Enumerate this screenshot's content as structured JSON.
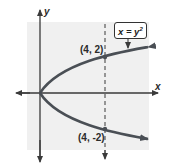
{
  "diagram": {
    "type": "parabola-graph",
    "axes": {
      "x_label": "x",
      "y_label": "y"
    },
    "equation": {
      "lhs": "x = y",
      "exponent": "2"
    },
    "points": [
      {
        "label": "(4, 2)",
        "x": 4,
        "y": 2
      },
      {
        "label": "(4, -2)",
        "x": 4,
        "y": -2
      }
    ],
    "reference_line": "x = 4 (dashed)",
    "colors": {
      "curve": "#4a4f55",
      "background": "#f0f0f0",
      "axes": "#3a3a3a"
    }
  }
}
